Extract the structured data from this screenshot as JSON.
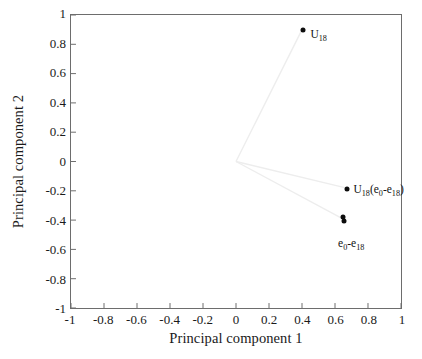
{
  "chart_data": {
    "type": "scatter",
    "title": "",
    "subtitle": "",
    "xlabel": "Principal component 1",
    "ylabel": "Principal component 2",
    "xlim": [
      -1,
      1
    ],
    "ylim": [
      -1,
      1
    ],
    "xticks": [
      "-1",
      "-0.8",
      "-0.6",
      "-0.4",
      "-0.2",
      "0",
      "0.2",
      "0.4",
      "0.6",
      "0.8",
      "1"
    ],
    "xtick_values": [
      -1,
      -0.8,
      -0.6,
      -0.4,
      -0.2,
      0,
      0.2,
      0.4,
      0.6,
      0.8,
      1
    ],
    "yticks": [
      "1",
      "0.8",
      "0.6",
      "0.4",
      "0.2",
      "0",
      "-0.2",
      "-0.4",
      "-0.6",
      "-0.8",
      "-1"
    ],
    "ytick_values": [
      1,
      0.8,
      0.6,
      0.4,
      0.2,
      0,
      -0.2,
      -0.4,
      -0.6,
      -0.8,
      -1
    ],
    "grid": false,
    "legend": "none",
    "origin": [
      0,
      0
    ],
    "vector_color": "#ededed",
    "marker_color": "#0d0d0d",
    "axis_color": "#6d6d6d",
    "points": [
      {
        "id": "u18",
        "x": 0.4,
        "y": 0.9,
        "label_html": "U<sub>18</sub>",
        "label_text": "U18",
        "label_dx": 7,
        "label_dy": -1
      },
      {
        "id": "u18-e0-e18",
        "x": 0.665,
        "y": -0.18,
        "label_html": "U<sub>18</sub>(e<sub>0</sub>-e<sub>18</sub>)",
        "label_text": "U18(e0-e18)",
        "label_dx": 6,
        "label_dy": -5
      },
      {
        "id": "e0-e18-a",
        "x": 0.638,
        "y": -0.368,
        "label_html": "",
        "label_text": "",
        "label_dx": 0,
        "label_dy": 0
      },
      {
        "id": "e0-e18-b",
        "x": 0.645,
        "y": -0.395,
        "label_html": "e<sub>0</sub>-e<sub>18</sub>",
        "label_text": "e0-e18",
        "label_dx": -6,
        "label_dy": 17
      }
    ],
    "vectors": [
      {
        "from": [
          0,
          0
        ],
        "to": [
          0.4,
          0.9
        ]
      },
      {
        "from": [
          0,
          0
        ],
        "to": [
          0.665,
          -0.18
        ]
      },
      {
        "from": [
          0,
          0
        ],
        "to": [
          0.645,
          -0.39
        ]
      }
    ]
  }
}
